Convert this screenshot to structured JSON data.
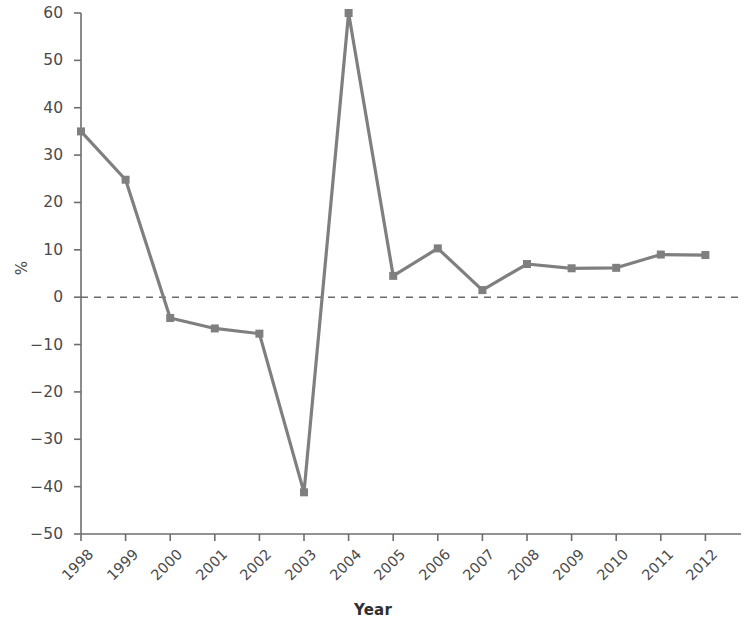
{
  "chart_data": {
    "type": "line",
    "title": "",
    "xlabel": "Year",
    "ylabel": "%",
    "categories": [
      "1998",
      "1999",
      "2000",
      "2001",
      "2002",
      "2003",
      "2004",
      "2005",
      "2006",
      "2007",
      "2008",
      "2009",
      "2010",
      "2011",
      "2012"
    ],
    "values": [
      35,
      24.8,
      -4.4,
      -6.6,
      -7.7,
      -41.2,
      60,
      4.5,
      10.3,
      1.5,
      7,
      6.1,
      6.2,
      9,
      8.9
    ],
    "series": [
      {
        "name": "",
        "values": [
          35,
          24.8,
          -4.4,
          -6.6,
          -7.7,
          -41.2,
          60,
          4.5,
          10.3,
          1.5,
          7,
          6.1,
          6.2,
          9,
          8.9
        ]
      }
    ],
    "ylim": [
      -50,
      60
    ],
    "yticks": [
      -50,
      -40,
      -30,
      -20,
      -10,
      0,
      10,
      20,
      30,
      40,
      50,
      60
    ],
    "ytick_labels": [
      "−50",
      "−40",
      "−30",
      "−20",
      "−10",
      "0",
      "10",
      "20",
      "30",
      "40",
      "50",
      "60"
    ],
    "grid": false,
    "legend": false,
    "legend_position": "none",
    "marker": "square",
    "line_color": "#7f7f7f",
    "marker_color": "#7f7f7f",
    "zero_reference_line": {
      "value": 0,
      "style": "dashed",
      "color": "#6b6b6b"
    },
    "axis_color": "#6e6e6e",
    "xtick_rotation": -45
  }
}
